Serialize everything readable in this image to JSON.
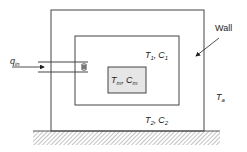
{
  "diagram": {
    "labels": {
      "q_in": {
        "main": "q",
        "sub": "in"
      },
      "wall": "Wall",
      "zone1": {
        "t": "T",
        "t_sub": "1",
        "sep": ",",
        "c": "C",
        "c_sub": "1"
      },
      "zone2": {
        "t": "T",
        "t_sub": "2",
        "sep": ",",
        "c": "C",
        "c_sub": "2"
      },
      "mass": {
        "t": "T",
        "t_sub": "m",
        "sep": ",",
        "c": "C",
        "c_sub": "m"
      },
      "ambient": {
        "t": "T",
        "t_sub": "a"
      }
    },
    "colors": {
      "line": "#444444",
      "mass_fill": "#e6e6e6",
      "ground_hatch": "#888888",
      "text": "#222222"
    }
  }
}
